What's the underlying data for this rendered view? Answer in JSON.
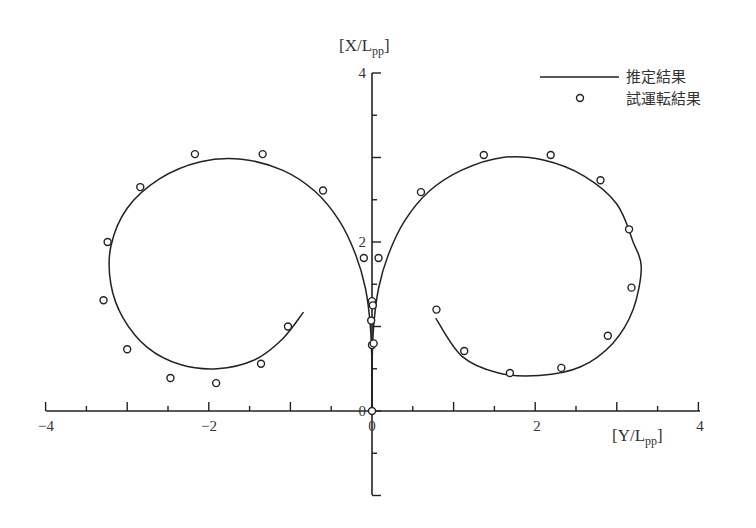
{
  "chart_data": {
    "type": "line",
    "title": "",
    "xlabel": "[Y/Lpp]",
    "ylabel": "[X/Lpp]",
    "xlim": [
      -4,
      4
    ],
    "ylim": [
      -1,
      4
    ],
    "x_ticks": [
      -4,
      -2,
      0,
      2,
      4
    ],
    "y_ticks": [
      0,
      2,
      4
    ],
    "grid": false,
    "legend_position": "upper-right",
    "legend": [
      {
        "label": "推定結果",
        "style": "line"
      },
      {
        "label": "試運転結果",
        "style": "circle-marker"
      }
    ],
    "series": [
      {
        "name": "推定結果",
        "style": "line",
        "points": [
          [
            0,
            0
          ],
          [
            0,
            0.5
          ],
          [
            -0.02,
            1.0
          ],
          [
            -0.08,
            1.45
          ],
          [
            -0.2,
            1.85
          ],
          [
            -0.4,
            2.25
          ],
          [
            -0.7,
            2.6
          ],
          [
            -1.1,
            2.85
          ],
          [
            -1.6,
            2.98
          ],
          [
            -2.1,
            2.95
          ],
          [
            -2.6,
            2.75
          ],
          [
            -3.0,
            2.4
          ],
          [
            -3.2,
            1.95
          ],
          [
            -3.2,
            1.5
          ],
          [
            -3.05,
            1.1
          ],
          [
            -2.75,
            0.75
          ],
          [
            -2.35,
            0.55
          ],
          [
            -1.9,
            0.5
          ],
          [
            -1.45,
            0.6
          ],
          [
            -1.1,
            0.85
          ],
          [
            -0.84,
            1.17
          ]
        ]
      },
      {
        "name": "推定結果 (right loop)",
        "style": "line",
        "points": [
          [
            0,
            0
          ],
          [
            0,
            0.5
          ],
          [
            0.02,
            1.0
          ],
          [
            0.08,
            1.45
          ],
          [
            0.2,
            1.85
          ],
          [
            0.4,
            2.25
          ],
          [
            0.7,
            2.6
          ],
          [
            1.1,
            2.85
          ],
          [
            1.6,
            3.0
          ],
          [
            2.1,
            2.97
          ],
          [
            2.6,
            2.78
          ],
          [
            3.0,
            2.45
          ],
          [
            3.2,
            2.0
          ],
          [
            3.3,
            1.7
          ],
          [
            3.2,
            1.2
          ],
          [
            2.95,
            0.8
          ],
          [
            2.55,
            0.52
          ],
          [
            2.05,
            0.42
          ],
          [
            1.55,
            0.45
          ],
          [
            1.1,
            0.65
          ],
          [
            0.78,
            1.1
          ]
        ]
      },
      {
        "name": "試運転結果",
        "style": "marker",
        "points": [
          [
            0,
            0
          ],
          [
            0.0,
            0.78
          ],
          [
            0.02,
            0.8
          ],
          [
            -0.01,
            1.07
          ],
          [
            0.0,
            1.3
          ],
          [
            0.01,
            1.25
          ],
          [
            -0.1,
            1.81
          ],
          [
            0.08,
            1.81
          ],
          [
            -0.6,
            2.61
          ],
          [
            -1.34,
            3.04
          ],
          [
            -2.17,
            3.04
          ],
          [
            -2.84,
            2.65
          ],
          [
            -3.24,
            2.0
          ],
          [
            -3.29,
            1.31
          ],
          [
            -3.0,
            0.73
          ],
          [
            -2.47,
            0.39
          ],
          [
            -1.91,
            0.33
          ],
          [
            -1.36,
            0.56
          ],
          [
            -1.03,
            1.0
          ],
          [
            0.6,
            2.59
          ],
          [
            1.37,
            3.03
          ],
          [
            2.19,
            3.03
          ],
          [
            2.8,
            2.73
          ],
          [
            3.15,
            2.15
          ],
          [
            3.18,
            1.46
          ],
          [
            2.89,
            0.89
          ],
          [
            2.32,
            0.51
          ],
          [
            1.69,
            0.45
          ],
          [
            1.13,
            0.71
          ],
          [
            0.79,
            1.2
          ]
        ]
      }
    ]
  },
  "axes": {
    "x_title_main": "[Y/L",
    "x_title_sub": "pp",
    "x_title_close": "]",
    "y_title_main": "[X/L",
    "y_title_sub": "pp",
    "y_title_close": "]",
    "x_tick_labels": [
      "−4",
      "−2",
      "0",
      "2",
      "4"
    ],
    "y_tick_labels": [
      "0",
      "2",
      "4"
    ],
    "origin_label": "0"
  },
  "legend": {
    "line_label": "推定結果",
    "marker_label": "試運転結果"
  }
}
